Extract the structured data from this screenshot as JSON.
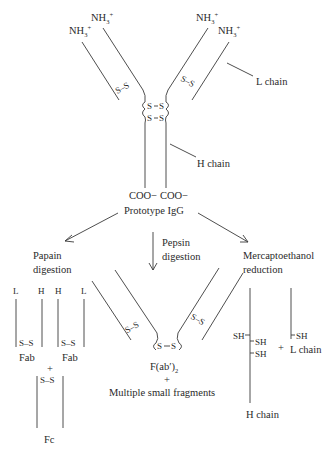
{
  "diagram": {
    "igg": {
      "nh3_labels": [
        "NH3+",
        "NH3+",
        "NH3+",
        "NH3+"
      ],
      "nh3_main": "NH",
      "nh3_sub": "3",
      "nh3_sup": "+",
      "l_chain_label": "L chain",
      "h_chain_label": "H chain",
      "coo_left": "COO−",
      "coo_right": "COO−",
      "name": "Prototype IgG",
      "disulfide": "S–S",
      "s": "S"
    },
    "branches": {
      "papain": {
        "label_line1": "Papain",
        "label_line2": "digestion",
        "chain_labels": [
          "L",
          "H",
          "H",
          "L"
        ],
        "fab_label": "Fab",
        "plus": "+",
        "fc_label": "Fc"
      },
      "pepsin": {
        "label_line1": "Pepsin",
        "label_line2": "digestion",
        "product_main": "F(ab′)",
        "product_sub": "2",
        "plus": "+",
        "fragments_label": "Multiple small fragments"
      },
      "mercaptoethanol": {
        "label_line1": "Mercaptoethanol",
        "label_line2": "reduction",
        "sh": "SH",
        "plus": "+",
        "l_chain_label": "L chain",
        "h_chain_label": "H chain"
      }
    }
  }
}
